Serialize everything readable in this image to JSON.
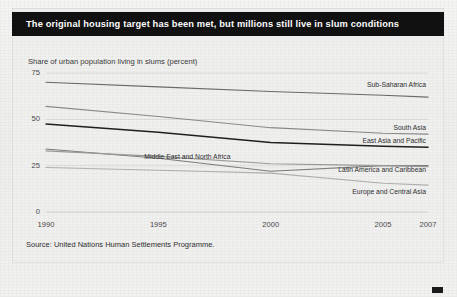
{
  "header": {
    "title": "The original housing target has been met, but millions still live in slum conditions"
  },
  "source": {
    "text": "Source: United Nations Human Settlements Programme."
  },
  "chart_data": {
    "type": "line",
    "title": "The original housing target has been met, but millions still live in slum conditions",
    "subtitle": "",
    "ylabel": "Share of urban population living in slums (percent)",
    "xlabel": "",
    "x": [
      1990,
      1995,
      2000,
      2005,
      2007
    ],
    "categories": [
      "1990",
      "1995",
      "2000",
      "2005",
      "2007"
    ],
    "xtick_labels": [
      "1990",
      "1995",
      "2000",
      "2005",
      "2007"
    ],
    "ytick_labels": [
      "0",
      "25",
      "50",
      "75"
    ],
    "ytick_values": [
      0,
      25,
      50,
      75
    ],
    "ylim": [
      0,
      75
    ],
    "xlim": [
      1990,
      2007
    ],
    "grid": true,
    "grid_axis": "y",
    "legend": "inline-right-labels",
    "series": [
      {
        "name": "Sub-Saharan Africa",
        "values": [
          70,
          67.5,
          65,
          63,
          62
        ],
        "color": "#6b6b6b",
        "width": 1.1,
        "label_x": 2005,
        "label_y": 68
      },
      {
        "name": "South Asia",
        "values": [
          57,
          51.5,
          45.5,
          42.5,
          42
        ],
        "color": "#8a8a8a",
        "width": 1.1,
        "label_x": 2005,
        "label_y": 45
      },
      {
        "name": "East Asia and Pacific",
        "values": [
          47.5,
          43,
          37.5,
          35.5,
          35
        ],
        "color": "#1f1f1f",
        "width": 1.5,
        "label_x": 2005,
        "label_y": 38
      },
      {
        "name": "Middle East and North Africa",
        "values": [
          34,
          29,
          22,
          25,
          25
        ],
        "color": "#7d7d7d",
        "width": 1.1,
        "label_x": 1995,
        "label_y": 29
      },
      {
        "name": "Latin America and Caribbean",
        "values": [
          33,
          30,
          26,
          25,
          24.5
        ],
        "color": "#9a9a9a",
        "width": 1.1,
        "label_x": 2004,
        "label_y": 22
      },
      {
        "name": "Europe and Central Asia",
        "values": [
          24,
          22.5,
          21,
          15.5,
          14.5
        ],
        "color": "#b0b0b0",
        "width": 1.1,
        "label_x": 2005,
        "label_y": 10
      }
    ]
  }
}
